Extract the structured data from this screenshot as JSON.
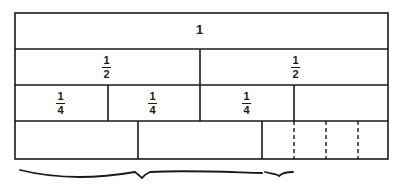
{
  "diagram": {
    "type": "fraction-strips",
    "rows": [
      {
        "label": "1",
        "cells": [
          {
            "label": "1"
          }
        ]
      },
      {
        "label": "halves",
        "cells": [
          {
            "num": "1",
            "den": "2"
          },
          {
            "num": "1",
            "den": "2"
          }
        ]
      },
      {
        "label": "quarters",
        "cells": [
          {
            "num": "1",
            "den": "4"
          },
          {
            "num": "1",
            "den": "4"
          },
          {
            "num": "1",
            "den": "4"
          },
          {
            "label": ""
          }
        ]
      },
      {
        "label": "unlabeled",
        "cells": [
          {
            "label": ""
          },
          {
            "label": ""
          },
          {
            "label": ""
          },
          {
            "label": "",
            "dashed": true
          },
          {
            "label": "",
            "dashed": true
          },
          {
            "label": "",
            "dashed": true
          }
        ]
      }
    ],
    "braces": [
      {
        "name": "large-brace",
        "from": 15,
        "to": 262
      },
      {
        "name": "small-brace",
        "from": 264,
        "to": 294
      }
    ],
    "colors": {
      "line": "#1a1a1a",
      "background": "#ffffff"
    }
  }
}
